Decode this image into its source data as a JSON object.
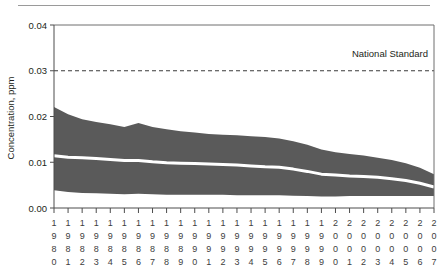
{
  "chart_data": {
    "type": "area",
    "title": "",
    "xlabel": "",
    "ylabel": "Concentration, ppm",
    "ylim": [
      0.0,
      0.04
    ],
    "yticks": [
      "0.00",
      "0.01",
      "0.02",
      "0.03",
      "0.04"
    ],
    "ytick_values": [
      0.0,
      0.01,
      0.02,
      0.03,
      0.04
    ],
    "grid": false,
    "legend": "none",
    "x": [
      1980,
      1981,
      1982,
      1983,
      1984,
      1985,
      1986,
      1987,
      1988,
      1989,
      1990,
      1991,
      1992,
      1993,
      1994,
      1995,
      1996,
      1997,
      1998,
      1999,
      2000,
      2001,
      2002,
      2003,
      2004,
      2005,
      2006,
      2007
    ],
    "xtick_labels": [
      "1980",
      "1981",
      "1982",
      "1983",
      "1984",
      "1985",
      "1986",
      "1987",
      "1988",
      "1989",
      "1990",
      "1991",
      "1992",
      "1993",
      "1994",
      "1995",
      "1996",
      "1997",
      "1998",
      "1999",
      "2000",
      "2001",
      "2002",
      "2003",
      "2004",
      "2005",
      "2006",
      "2007"
    ],
    "series": [
      {
        "name": "90th Percentile",
        "role": "band-upper",
        "values": [
          0.0221,
          0.0205,
          0.0194,
          0.0188,
          0.0183,
          0.0177,
          0.0186,
          0.0177,
          0.0172,
          0.0168,
          0.0165,
          0.0162,
          0.016,
          0.0159,
          0.0157,
          0.0155,
          0.0152,
          0.0146,
          0.0138,
          0.0128,
          0.0122,
          0.0118,
          0.0115,
          0.011,
          0.0105,
          0.0098,
          0.0088,
          0.0074
        ]
      },
      {
        "name": "Median",
        "role": "median",
        "values": [
          0.0114,
          0.0111,
          0.011,
          0.0108,
          0.0106,
          0.0104,
          0.0104,
          0.0101,
          0.0099,
          0.0098,
          0.0097,
          0.0096,
          0.0095,
          0.0094,
          0.0092,
          0.009,
          0.0089,
          0.0085,
          0.008,
          0.0074,
          0.0072,
          0.007,
          0.0069,
          0.0067,
          0.0064,
          0.006,
          0.0054,
          0.0046
        ]
      },
      {
        "name": "10th Percentile",
        "role": "band-lower",
        "values": [
          0.0039,
          0.0035,
          0.0033,
          0.0032,
          0.0031,
          0.003,
          0.0031,
          0.003,
          0.0029,
          0.0029,
          0.0029,
          0.0029,
          0.0029,
          0.0028,
          0.0028,
          0.0028,
          0.0028,
          0.0027,
          0.0026,
          0.0025,
          0.0025,
          0.0026,
          0.0026,
          0.0026,
          0.0026,
          0.0026,
          0.0026,
          0.0026
        ]
      }
    ],
    "annotations": [
      {
        "name": "national-standard",
        "label": "National Standard",
        "value": 0.03,
        "style": "dashed-horizontal-line"
      }
    ],
    "colors": {
      "band": "#5a5a5a",
      "median": "#ffffff",
      "axis": "#4d4d4d",
      "standard_line": "#3a3a3a",
      "text": "#231f20",
      "background": "#ffffff"
    }
  }
}
